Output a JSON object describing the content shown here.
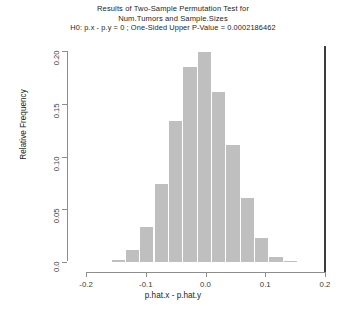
{
  "chart_data": {
    "type": "bar",
    "title": "Results of Two-Sample Permutation Test for",
    "title_line2": "Num.Tumors and Sample.Sizes",
    "title_line3": "H0: p.x - p.y = 0 ;  One-Sided Upper P-Value = 0.0002186462",
    "xlabel": "p.hat.x - p.hat.y",
    "ylabel": "Relative Frequency",
    "xlim": [
      -0.2,
      0.2
    ],
    "ylim": [
      0.0,
      0.205
    ],
    "xticks": [
      -0.2,
      -0.1,
      0.0,
      0.1,
      0.2
    ],
    "xtick_labels": [
      "-0.2",
      "-0.1",
      "0.0",
      "0.1",
      "0.2"
    ],
    "yticks": [
      0.0,
      0.05,
      0.1,
      0.15,
      0.2
    ],
    "ytick_labels": [
      "0.0",
      "0.05",
      "0.10",
      "0.15",
      "0.20"
    ],
    "grid": false,
    "legend": "none",
    "bin_width": 0.024,
    "bar_color": "#bfbfbf",
    "categories": [
      -0.145,
      -0.121,
      -0.097,
      -0.073,
      -0.049,
      -0.025,
      -0.001,
      0.023,
      0.047,
      0.071,
      0.095,
      0.119,
      0.143
    ],
    "values": [
      0.002,
      0.011,
      0.033,
      0.074,
      0.134,
      0.185,
      0.199,
      0.161,
      0.111,
      0.061,
      0.023,
      0.005,
      0.001
    ],
    "annotations": [
      {
        "name": "observed-statistic-line",
        "x": 0.2,
        "color": "#3d3d3d",
        "description": "vertical line at observed test statistic"
      }
    ]
  }
}
